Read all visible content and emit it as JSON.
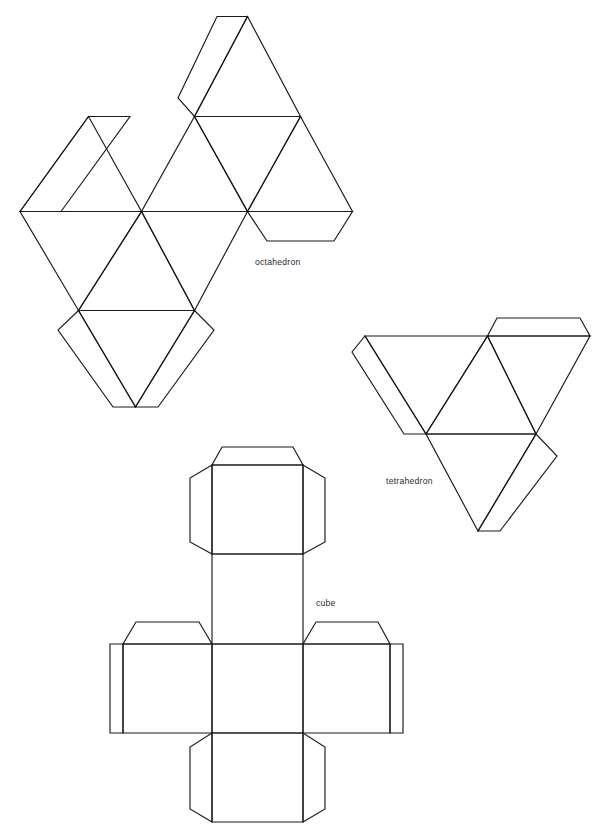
{
  "page": {
    "background_color": "#ffffff",
    "ink_color": "#1a1a1a",
    "width": 609,
    "height": 836
  },
  "diagram": {
    "kind": "geometric-nets",
    "figures": [
      {
        "id": "octahedron",
        "label": "octahedron",
        "label_x": 255,
        "label_y": 265,
        "faces": 8,
        "face_shape": "equilateral triangle",
        "tabs": 4
      },
      {
        "id": "tetrahedron",
        "label": "tetrahedron",
        "label_x": 386,
        "label_y": 484,
        "faces": 4,
        "face_shape": "equilateral triangle",
        "tabs": 3
      },
      {
        "id": "cube",
        "label": "cube",
        "label_x": 316,
        "label_y": 606,
        "faces": 6,
        "face_shape": "square",
        "tabs": 7
      }
    ]
  },
  "geometry": {
    "octahedron": {
      "outline": "M 247.5 16.5 L 352.5 211.5 L 141.5 211.5 Z",
      "paths": [
        "M 247.5 16.5 L 352.5 211.5 L 141.5 211.5 Z",
        "M 194.5 116.5 L 300.5 116.5",
        "M 141.5 211.5 L 88.5 116.5",
        "M 20.0 211.5 L 141.5 211.5",
        "M 20.0 211.5 L 78.5 310.5",
        "M 78.5 310.5 L 194.5 310.5",
        "M 194.5 310.5 L 141.5 211.5",
        "M 78.5 310.5 L 135.5 407.0",
        "M 135.5 407.0 L 194.5 310.5"
      ]
    },
    "tetrahedron": {
      "outline": "M 490.0 330.0 L 545.0 434.0 L 430.0 434.0 Z"
    },
    "cube": {
      "square_size": 90,
      "tab_depth": 20,
      "center_square": {
        "x": 212,
        "y": 644,
        "w": 91,
        "h": 89
      }
    }
  },
  "labels": {
    "octahedron": "octahedron",
    "tetrahedron": "tetrahedron",
    "cube": "cube"
  }
}
